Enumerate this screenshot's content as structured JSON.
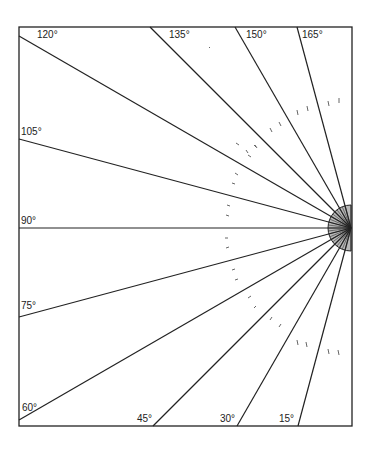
{
  "diagram": {
    "type": "protractor-angle-lines",
    "frame": {
      "x1": 19,
      "y1": 27,
      "x2": 352,
      "y2": 426
    },
    "center": {
      "x": 351,
      "y": 228
    },
    "hub_radius": 23,
    "hub_fill": "#b8b8b8",
    "line_color": "#222222",
    "labels": [
      {
        "id": "a120",
        "text": "120°",
        "x": 37,
        "y": 30
      },
      {
        "id": "a135",
        "text": "135°",
        "x": 168,
        "y": 30
      },
      {
        "id": "a150",
        "text": "150°",
        "x": 246,
        "y": 30
      },
      {
        "id": "a165",
        "text": "165°",
        "x": 302,
        "y": 30
      },
      {
        "id": "a105",
        "text": "105°",
        "x": 21,
        "y": 127
      },
      {
        "id": "a90",
        "text": "90°",
        "x": 21,
        "y": 216
      },
      {
        "id": "a75",
        "text": "75°",
        "x": 21,
        "y": 301
      },
      {
        "id": "a60",
        "text": "60°",
        "x": 21,
        "y": 403
      },
      {
        "id": "a45",
        "text": "45°",
        "x": 137,
        "y": 415
      },
      {
        "id": "a30",
        "text": "30°",
        "x": 220,
        "y": 415
      },
      {
        "id": "a15",
        "text": "15°",
        "x": 280,
        "y": 415
      }
    ],
    "angles": [
      15,
      30,
      45,
      60,
      75,
      90,
      105,
      120,
      135,
      150,
      165
    ]
  }
}
